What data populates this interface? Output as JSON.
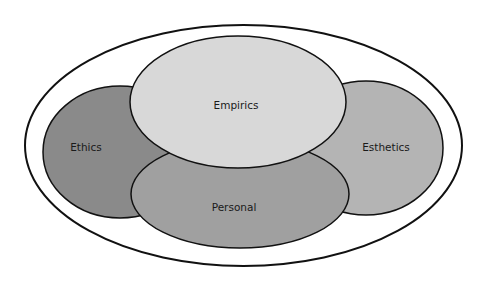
{
  "diagram": {
    "type": "overlapping-ellipses",
    "title": "",
    "outer_boundary": {
      "fill": "#ffffff",
      "stroke": "#111111"
    },
    "regions": [
      {
        "id": "ethics",
        "label": "Ethics",
        "fill": "#8a8a8a"
      },
      {
        "id": "esthetics",
        "label": "Esthetics",
        "fill": "#b4b4b4"
      },
      {
        "id": "personal",
        "label": "Personal",
        "fill": "#a0a0a0"
      },
      {
        "id": "empirics",
        "label": "Empirics",
        "fill": "#d8d8d8"
      }
    ]
  }
}
